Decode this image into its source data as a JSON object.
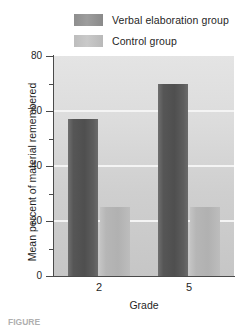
{
  "chart_data": {
    "type": "bar",
    "title": "",
    "categories": [
      "2",
      "5"
    ],
    "series": [
      {
        "name": "Verbal elaboration group",
        "values": [
          57,
          70
        ],
        "color": "#555555"
      },
      {
        "name": "Control group",
        "values": [
          25,
          25
        ],
        "color": "#b6b6b6"
      }
    ],
    "xlabel": "Grade",
    "ylabel": "Mean percent of material remembered",
    "ylim": [
      0,
      80
    ],
    "ytick_labels": [
      "0",
      "20",
      "40",
      "60",
      "80"
    ],
    "ytick_values": [
      0,
      20,
      40,
      60,
      80
    ],
    "yminor_values": [
      10,
      30,
      50,
      70
    ],
    "gridlines": [
      20,
      40,
      60
    ],
    "grid": true,
    "legend_position": "top"
  },
  "legend": {
    "entries": [
      {
        "label": "Verbal elaboration group"
      },
      {
        "label": "Control group"
      }
    ]
  },
  "axes": {
    "y_title": "Mean percent of material remembered",
    "x_title": "Grade",
    "y_labels": [
      "80",
      "60",
      "40",
      "20",
      "0"
    ],
    "x_labels": [
      "2",
      "5"
    ]
  },
  "caption": {
    "text": "FIGURE"
  },
  "colors": {
    "series_verbal": "#555555",
    "series_control": "#b6b6b6",
    "plot_background": "#d6d6d6",
    "gridline": "#f4f4f4",
    "axis": "#4a4a4a",
    "text": "#1f1f1f"
  }
}
